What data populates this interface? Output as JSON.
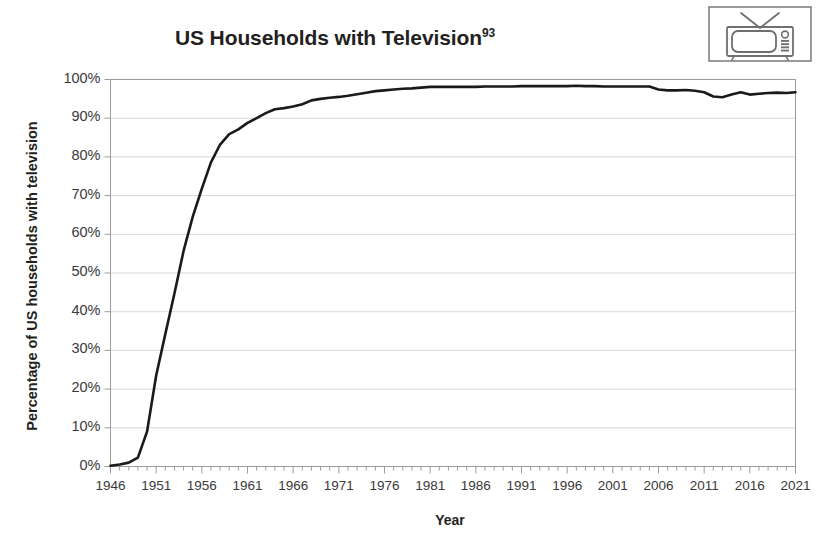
{
  "chart_data": {
    "type": "line",
    "title": "US Households with Television",
    "title_superscript": "93",
    "xlabel": "Year",
    "ylabel": "Percentage of US households with television",
    "xlim": [
      1946,
      2021
    ],
    "ylim": [
      0,
      100
    ],
    "grid": "horizontal",
    "legend": "none",
    "series_color": "#1a1a1a",
    "gridline_color": "#d8d8d8",
    "axis_color": "#8c8c8c",
    "y_tick_labels": [
      "100%",
      "90%",
      "80%",
      "70%",
      "60%",
      "50%",
      "40%",
      "30%",
      "20%",
      "10%",
      "0%"
    ],
    "y_tick_values": [
      100,
      90,
      80,
      70,
      60,
      50,
      40,
      30,
      20,
      10,
      0
    ],
    "x_tick_labels": [
      "1946",
      "1951",
      "1956",
      "1961",
      "1966",
      "1971",
      "1976",
      "1981",
      "1986",
      "1991",
      "1996",
      "2001",
      "2006",
      "2011",
      "2016",
      "2021"
    ],
    "x_tick_values": [
      1946,
      1951,
      1956,
      1961,
      1966,
      1971,
      1976,
      1981,
      1986,
      1991,
      1996,
      2001,
      2006,
      2011,
      2016,
      2021
    ],
    "x_minor_tick_interval": 1,
    "x": [
      1946,
      1947,
      1948,
      1949,
      1950,
      1951,
      1952,
      1953,
      1954,
      1955,
      1956,
      1957,
      1958,
      1959,
      1960,
      1961,
      1962,
      1963,
      1964,
      1965,
      1966,
      1967,
      1968,
      1969,
      1970,
      1971,
      1972,
      1973,
      1974,
      1975,
      1976,
      1977,
      1978,
      1979,
      1980,
      1981,
      1982,
      1983,
      1984,
      1985,
      1986,
      1987,
      1988,
      1989,
      1990,
      1991,
      1992,
      1993,
      1994,
      1995,
      1996,
      1997,
      1998,
      1999,
      2000,
      2001,
      2002,
      2003,
      2004,
      2005,
      2006,
      2007,
      2008,
      2009,
      2010,
      2011,
      2012,
      2013,
      2014,
      2015,
      2016,
      2017,
      2018,
      2019,
      2020,
      2021
    ],
    "values": [
      0.2,
      0.5,
      1.0,
      2.3,
      9.0,
      23.5,
      34.2,
      44.7,
      55.7,
      64.5,
      71.8,
      78.6,
      83.2,
      85.9,
      87.1,
      88.8,
      90.0,
      91.3,
      92.3,
      92.6,
      93.0,
      93.6,
      94.6,
      95.0,
      95.3,
      95.5,
      95.8,
      96.2,
      96.6,
      97.0,
      97.2,
      97.4,
      97.6,
      97.7,
      97.9,
      98.1,
      98.1,
      98.1,
      98.1,
      98.1,
      98.1,
      98.2,
      98.2,
      98.2,
      98.2,
      98.3,
      98.3,
      98.3,
      98.3,
      98.3,
      98.3,
      98.4,
      98.3,
      98.3,
      98.2,
      98.2,
      98.2,
      98.2,
      98.2,
      98.2,
      97.4,
      97.2,
      97.2,
      97.3,
      97.1,
      96.7,
      95.6,
      95.4,
      96.1,
      96.7,
      96.1,
      96.3,
      96.5,
      96.6,
      96.5,
      96.7
    ]
  },
  "icon": {
    "tv_icon_name": "retro-television-icon"
  }
}
